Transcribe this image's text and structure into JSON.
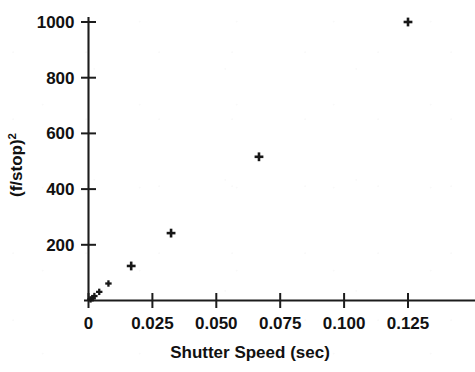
{
  "figure": {
    "background_color": "#ffffff",
    "ink_color": "#171717"
  },
  "chart_data": {
    "type": "scatter",
    "title": "",
    "subtitle": "",
    "xlabel": "Shutter Speed (sec)",
    "ylabel": "(f/stop)",
    "ylabel_exponent": "2",
    "xlim": [
      0,
      0.1453
    ],
    "ylim": [
      0,
      1080
    ],
    "xticks": [
      0,
      0.025,
      0.05,
      0.075,
      0.1,
      0.125
    ],
    "xtick_labels": [
      "0",
      "0.025",
      "0.050",
      "0.075",
      "0.100",
      "0.125"
    ],
    "yticks": [
      200,
      400,
      600,
      800,
      1000
    ],
    "ytick_labels": [
      "200",
      "400",
      "600",
      "800",
      "1000"
    ],
    "grid": false,
    "legend": null,
    "legend_position": "none",
    "marker": "plus",
    "marker_color": "#171717",
    "series": [
      {
        "name": "exposure pairs",
        "points": [
          {
            "x": 0.0008,
            "y": 4
          },
          {
            "x": 0.0016,
            "y": 8
          },
          {
            "x": 0.0023,
            "y": 16
          },
          {
            "x": 0.0042,
            "y": 31
          },
          {
            "x": 0.0078,
            "y": 61
          },
          {
            "x": 0.0167,
            "y": 124
          },
          {
            "x": 0.0323,
            "y": 242
          },
          {
            "x": 0.0667,
            "y": 516
          },
          {
            "x": 0.125,
            "y": 1000
          }
        ]
      }
    ]
  },
  "axes": {
    "x_axis_name": "x-axis",
    "y_axis_name": "y-axis"
  }
}
